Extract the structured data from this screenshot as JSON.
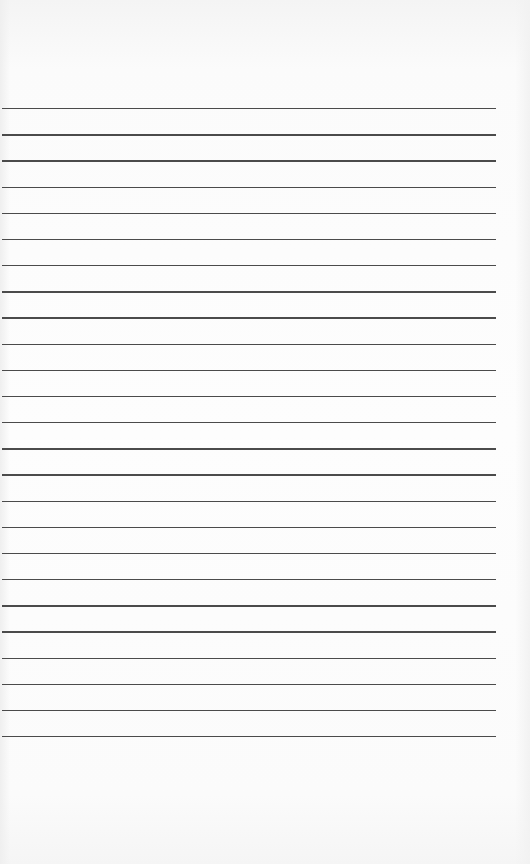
{
  "sheet": {
    "type": "lined-paper",
    "line_count": 25,
    "first_line_y": 108,
    "line_spacing": 26.17,
    "line_left": 2,
    "line_right": 496,
    "line_color": "#3c3c3c",
    "paper_color": "#fdfdfd"
  }
}
